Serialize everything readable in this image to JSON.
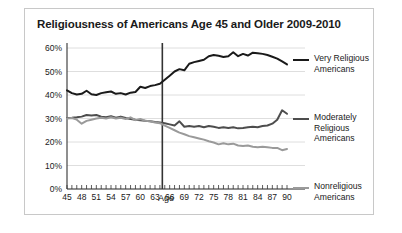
{
  "figure": {
    "title": "Religiousness of Americans Age 45 and Older 2009-2010",
    "x_axis_title": "Age",
    "border_color": "#c8c8c8",
    "background": "#ffffff"
  },
  "legend": {
    "entries": [
      {
        "label": "Very Religious Americans",
        "color": "#1a1a1a"
      },
      {
        "label": "Moderately Religious Americans",
        "color": "#4d4d4d"
      },
      {
        "label": "Nonreligious Americans",
        "color": "#9a9a9a"
      }
    ]
  },
  "chart_data": {
    "type": "line",
    "title": "Religiousness of Americans Age 45 and Older 2009-2010",
    "xlabel": "Age",
    "ylabel": "",
    "xlim": [
      45,
      90
    ],
    "ylim": [
      0,
      60
    ],
    "ytick_labels": [
      "0%",
      "10%",
      "20%",
      "30%",
      "40%",
      "50%",
      "60%"
    ],
    "ytick_values": [
      0,
      10,
      20,
      30,
      40,
      50,
      60
    ],
    "xtick_labels": [
      "45",
      "48",
      "51",
      "54",
      "57",
      "60",
      "63",
      "66",
      "69",
      "72",
      "75",
      "78",
      "81",
      "84",
      "87",
      "90"
    ],
    "xtick_values": [
      45,
      48,
      51,
      54,
      57,
      60,
      63,
      66,
      69,
      72,
      75,
      78,
      81,
      84,
      87,
      90
    ],
    "minor_tick_interval": 1,
    "grid": "horizontal",
    "legend_position": "right",
    "annotations": [
      {
        "type": "vertical-line",
        "x": 64.5,
        "color": "#333333"
      }
    ],
    "x": [
      45,
      46,
      47,
      48,
      49,
      50,
      51,
      52,
      53,
      54,
      55,
      56,
      57,
      58,
      59,
      60,
      61,
      62,
      63,
      64,
      65,
      66,
      67,
      68,
      69,
      70,
      71,
      72,
      73,
      74,
      75,
      76,
      77,
      78,
      79,
      80,
      81,
      82,
      83,
      84,
      85,
      86,
      87,
      88,
      89,
      90
    ],
    "series": [
      {
        "name": "Very Religious Americans",
        "color": "#1a1a1a",
        "values": [
          42.0,
          40.8,
          40.2,
          40.5,
          41.8,
          40.3,
          40.0,
          40.8,
          41.2,
          41.5,
          40.5,
          40.8,
          40.2,
          41.0,
          41.3,
          43.5,
          43.0,
          43.8,
          44.2,
          44.8,
          46.5,
          48.2,
          50.0,
          51.0,
          50.5,
          53.3,
          54.0,
          54.5,
          55.0,
          56.5,
          57.0,
          56.7,
          56.2,
          56.5,
          58.2,
          56.5,
          57.5,
          56.8,
          58.0,
          57.8,
          57.5,
          57.0,
          56.3,
          55.5,
          54.3,
          53.0
        ]
      },
      {
        "name": "Moderately Religious Americans",
        "color": "#4d4d4d",
        "values": [
          30.2,
          30.3,
          30.5,
          30.8,
          31.5,
          31.3,
          31.5,
          30.8,
          30.5,
          31.0,
          30.3,
          30.8,
          30.2,
          29.8,
          29.5,
          29.3,
          29.0,
          28.8,
          28.5,
          28.3,
          28.0,
          27.5,
          27.0,
          28.8,
          26.5,
          26.8,
          26.5,
          26.8,
          26.3,
          26.8,
          26.5,
          26.0,
          26.3,
          26.0,
          26.3,
          25.8,
          26.0,
          26.3,
          26.5,
          26.3,
          26.8,
          27.0,
          27.8,
          29.5,
          33.5,
          32.0
        ]
      },
      {
        "name": "Nonreligious Americans",
        "color": "#9a9a9a",
        "values": [
          30.0,
          30.2,
          29.5,
          27.8,
          29.0,
          29.5,
          30.0,
          30.3,
          30.0,
          30.5,
          30.0,
          30.3,
          29.8,
          30.5,
          29.3,
          29.8,
          29.0,
          28.8,
          28.3,
          28.0,
          27.0,
          26.0,
          25.0,
          24.0,
          23.3,
          22.5,
          22.0,
          21.5,
          21.0,
          20.3,
          19.8,
          19.0,
          19.5,
          19.0,
          19.3,
          18.5,
          18.3,
          18.5,
          18.0,
          17.8,
          18.0,
          17.8,
          17.5,
          17.5,
          16.5,
          17.0
        ]
      }
    ]
  }
}
